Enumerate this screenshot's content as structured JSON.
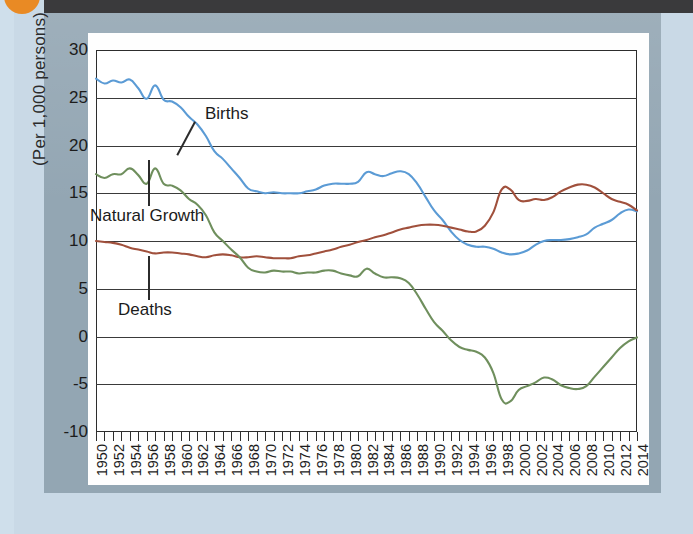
{
  "frame": {
    "orange_dot_color": "#e98a24",
    "top_bar_color": "#3a3a3c",
    "figure_frame_color": "#93a6b3",
    "sheet_color": "#fefefe"
  },
  "chart_data": {
    "type": "line",
    "title": "",
    "xlabel": "",
    "ylabel": "(Per 1,000 persons)",
    "ylim": [
      -10,
      30
    ],
    "xlim": [
      1950,
      2014
    ],
    "grid": true,
    "legend_position": "inline-annotations",
    "yticks": [
      30,
      25,
      20,
      15,
      10,
      5,
      0,
      -5,
      -10
    ],
    "xticks": [
      "1950",
      "1952",
      "1954",
      "1956",
      "1958",
      "1960",
      "1962",
      "1964",
      "1966",
      "1968",
      "1970",
      "1972",
      "1974",
      "1976",
      "1978",
      "1980",
      "1982",
      "1984",
      "1986",
      "1988",
      "1990",
      "1992",
      "1994",
      "1996",
      "1998",
      "2000",
      "2002",
      "2004",
      "2006",
      "2008",
      "2010",
      "2012",
      "2014"
    ],
    "x": [
      1950,
      1951,
      1952,
      1953,
      1954,
      1955,
      1956,
      1957,
      1958,
      1959,
      1960,
      1961,
      1962,
      1963,
      1964,
      1965,
      1966,
      1967,
      1968,
      1969,
      1970,
      1971,
      1972,
      1973,
      1974,
      1975,
      1976,
      1977,
      1978,
      1979,
      1980,
      1981,
      1982,
      1983,
      1984,
      1985,
      1986,
      1987,
      1988,
      1989,
      1990,
      1991,
      1992,
      1993,
      1994,
      1995,
      1996,
      1997,
      1998,
      1999,
      2000,
      2001,
      2002,
      2003,
      2004,
      2005,
      2006,
      2007,
      2008,
      2009,
      2010,
      2011,
      2012,
      2013,
      2014
    ],
    "series": [
      {
        "name": "Births",
        "color": "#5b9bd5",
        "values": [
          27.0,
          26.5,
          26.8,
          26.6,
          26.9,
          26.0,
          24.9,
          26.3,
          24.8,
          24.6,
          24.0,
          23.0,
          22.2,
          21.0,
          19.4,
          18.6,
          17.6,
          16.6,
          15.5,
          15.2,
          15.0,
          15.1,
          15.0,
          15.0,
          15.0,
          15.2,
          15.4,
          15.8,
          16.0,
          16.0,
          16.0,
          16.2,
          17.2,
          17.0,
          16.8,
          17.1,
          17.3,
          17.0,
          16.0,
          14.6,
          13.2,
          12.2,
          11.0,
          10.1,
          9.6,
          9.4,
          9.4,
          9.2,
          8.8,
          8.6,
          8.7,
          9.0,
          9.6,
          10.0,
          10.1,
          10.1,
          10.2,
          10.4,
          10.7,
          11.4,
          11.8,
          12.2,
          12.9,
          13.3,
          13.1
        ]
      },
      {
        "name": "Deaths",
        "color": "#a0503c",
        "values": [
          10.0,
          9.9,
          9.8,
          9.6,
          9.3,
          9.1,
          8.9,
          8.7,
          8.8,
          8.8,
          8.7,
          8.6,
          8.4,
          8.3,
          8.5,
          8.6,
          8.5,
          8.3,
          8.3,
          8.4,
          8.3,
          8.2,
          8.2,
          8.2,
          8.4,
          8.5,
          8.7,
          8.9,
          9.1,
          9.4,
          9.6,
          9.9,
          10.1,
          10.4,
          10.6,
          10.9,
          11.2,
          11.4,
          11.6,
          11.7,
          11.7,
          11.6,
          11.4,
          11.2,
          11.0,
          11.0,
          11.6,
          13.0,
          15.4,
          15.4,
          14.3,
          14.2,
          14.4,
          14.3,
          14.6,
          15.2,
          15.6,
          15.9,
          15.9,
          15.6,
          15.0,
          14.4,
          14.1,
          13.8,
          13.2
        ]
      },
      {
        "name": "Natural Growth",
        "color": "#6f8f5d",
        "values": [
          17.0,
          16.6,
          17.0,
          17.0,
          17.6,
          16.9,
          16.0,
          17.6,
          16.0,
          15.8,
          15.3,
          14.4,
          13.8,
          12.7,
          10.9,
          10.0,
          9.1,
          8.3,
          7.2,
          6.8,
          6.7,
          6.9,
          6.8,
          6.8,
          6.6,
          6.7,
          6.7,
          6.9,
          6.9,
          6.6,
          6.4,
          6.3,
          7.1,
          6.6,
          6.2,
          6.2,
          6.1,
          5.6,
          4.4,
          2.9,
          1.5,
          0.6,
          -0.4,
          -1.1,
          -1.4,
          -1.6,
          -2.2,
          -3.8,
          -6.6,
          -6.8,
          -5.6,
          -5.2,
          -4.8,
          -4.3,
          -4.5,
          -5.1,
          -5.4,
          -5.5,
          -5.2,
          -4.2,
          -3.2,
          -2.2,
          -1.2,
          -0.5,
          -0.1
        ]
      }
    ],
    "annotations": [
      {
        "label": "Births",
        "series": "Births"
      },
      {
        "label": "Natural Growth",
        "series": "Natural Growth"
      },
      {
        "label": "Deaths",
        "series": "Deaths"
      }
    ]
  }
}
